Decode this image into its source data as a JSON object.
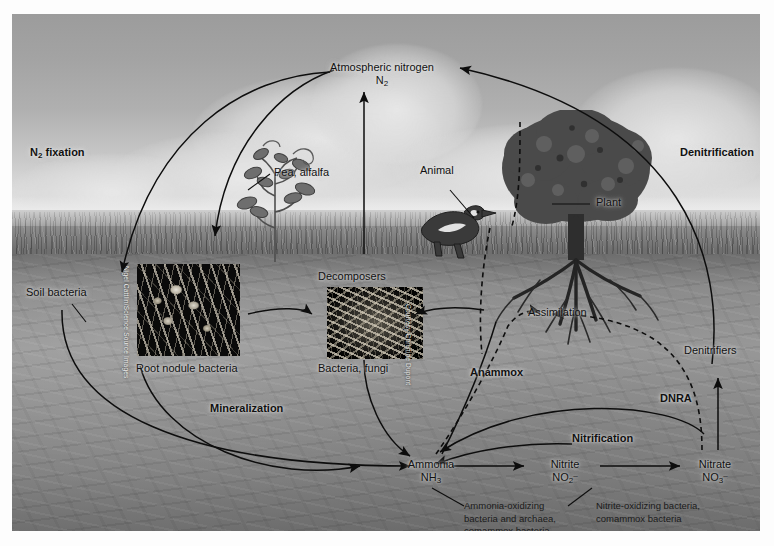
{
  "figure": {
    "background_colors": {
      "sky": "#a8a8a8",
      "horizon_haze": "#e6e6e6",
      "grass": "#7a7a7a",
      "soil": "#8f8f8f",
      "ink": "#0d0d0d",
      "page": "#ffffff"
    }
  },
  "labels": {
    "atmospheric_nitrogen": "Atmospheric nitrogen",
    "atmospheric_nitrogen_formula": "N2",
    "n2_fixation": "N2 fixation",
    "denitrification": "Denitrification",
    "soil_bacteria": "Soil bacteria",
    "pea_alfalfa": "Pea, alfalfa",
    "root_nodule_bacteria": "Root nodule bacteria",
    "decomposers": "Decomposers",
    "bacteria_fungi": "Bacteria, fungi",
    "animal": "Animal",
    "plant": "Plant",
    "assimilation": "Assimilation",
    "anammox": "Anammox",
    "mineralization": "Mineralization",
    "dnra": "DNRA",
    "nitrification": "Nitrification",
    "denitrifiers": "Denitrifiers"
  },
  "compounds": [
    {
      "id": "ammonia",
      "name": "Ammonia",
      "formula_base": "NH",
      "formula_sub": "3",
      "formula_sup": ""
    },
    {
      "id": "nitrite",
      "name": "Nitrite",
      "formula_base": "NO",
      "formula_sub": "2",
      "formula_sup": "–"
    },
    {
      "id": "nitrate",
      "name": "Nitrate",
      "formula_base": "NO",
      "formula_sub": "3",
      "formula_sup": "–"
    }
  ],
  "captions": {
    "ammonia_oxidizers": [
      "Ammonia-oxidizing",
      "bacteria and archaea,",
      "comammox bacteria"
    ],
    "nitrite_oxidizers": [
      "Nitrite-oxidizing bacteria,",
      "comammox bacteria"
    ]
  },
  "credits": {
    "root_nodule_photo": "Nigel Cattlin/Science Source Images",
    "decomposer_photo": "Courtesy Christine Dupont"
  }
}
